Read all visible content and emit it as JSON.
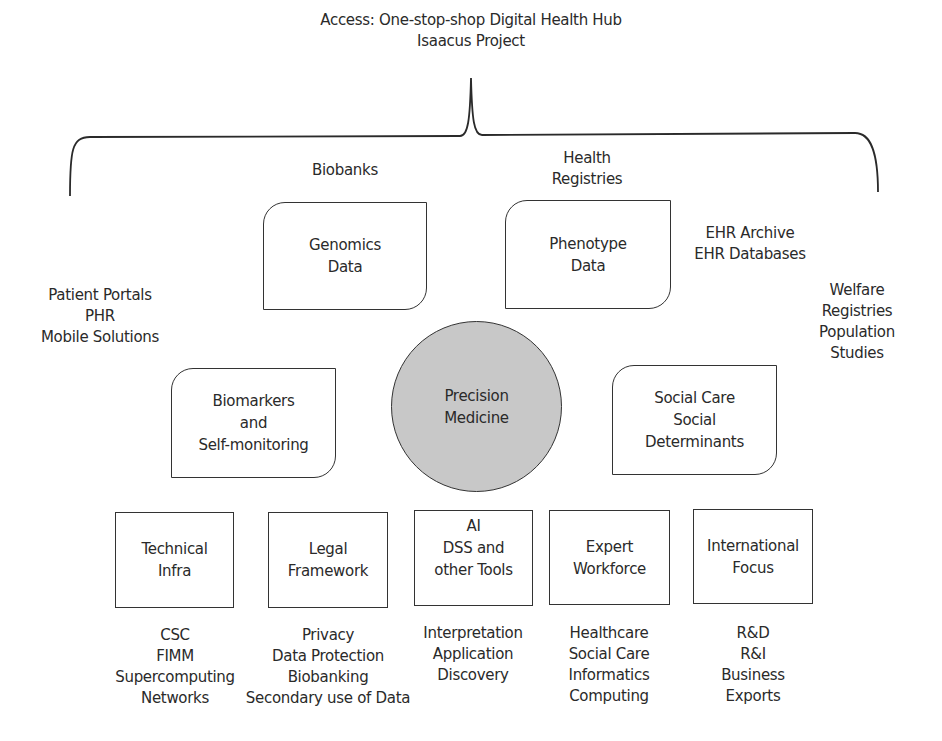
{
  "header": {
    "lines": [
      "Access: One-stop-shop Digital Health Hub",
      "Isaacus Project"
    ]
  },
  "top_labels": {
    "biobanks": [
      "Biobanks"
    ],
    "health_registries": [
      "Health",
      "Registries"
    ]
  },
  "side_labels": {
    "patient": [
      "Patient Portals",
      "PHR",
      "Mobile Solutions"
    ],
    "ehr": [
      "EHR Archive",
      "EHR Databases"
    ],
    "welfare": [
      "Welfare",
      "Registries",
      "Population",
      "Studies"
    ]
  },
  "rounded_boxes": {
    "genomics": [
      "Genomics",
      "Data"
    ],
    "phenotype": [
      "Phenotype",
      "Data"
    ],
    "biomarkers": [
      "Biomarkers",
      "and",
      "Self-monitoring"
    ],
    "social_care": [
      "Social Care",
      "Social",
      "Determinants"
    ]
  },
  "center": {
    "lines": [
      "Precision",
      "Medicine"
    ],
    "fill": "#c8c8c8"
  },
  "pillars": [
    {
      "title": [
        "Technical",
        "Infra"
      ],
      "items": [
        "CSC",
        "FIMM",
        "Supercomputing",
        "Networks"
      ]
    },
    {
      "title": [
        "Legal",
        "Framework"
      ],
      "items": [
        "Privacy",
        "Data Protection",
        "Biobanking",
        "Secondary use of Data"
      ]
    },
    {
      "title": [
        "AI",
        "DSS and",
        "other Tools"
      ],
      "items": [
        "Interpretation",
        "Application",
        "Discovery"
      ]
    },
    {
      "title": [
        "Expert",
        "Workforce"
      ],
      "items": [
        "Healthcare",
        "Social Care",
        "Informatics",
        "Computing"
      ]
    },
    {
      "title": [
        "International",
        "Focus"
      ],
      "items": [
        "R&D",
        "R&I",
        "Business",
        "Exports"
      ]
    }
  ]
}
